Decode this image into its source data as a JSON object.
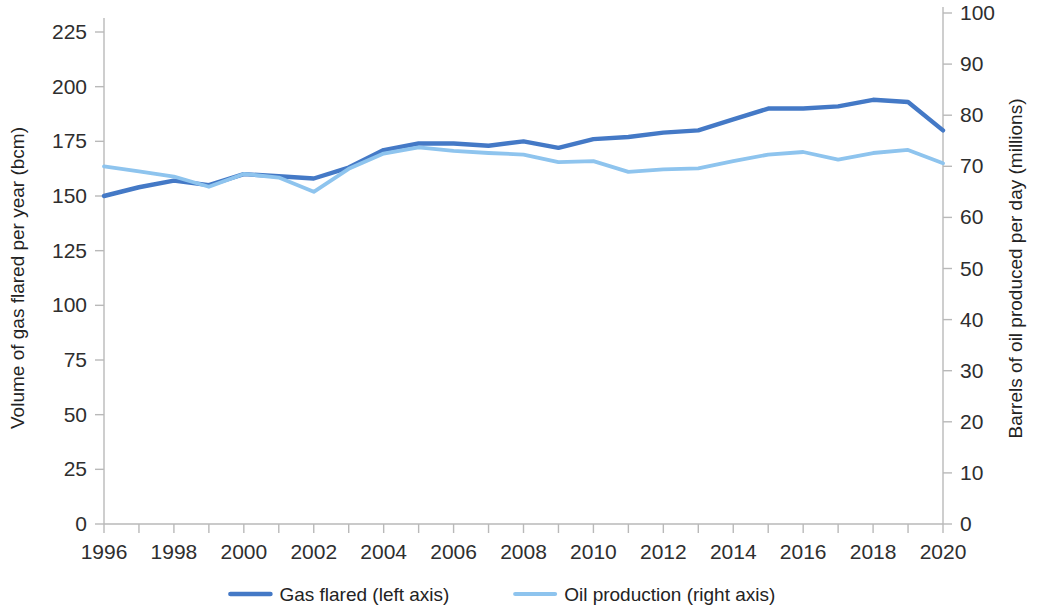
{
  "chart_data": {
    "type": "line",
    "title": "",
    "subtitle": "",
    "xlabel": "",
    "ylabel": "Volume of gas flared per year (bcm)",
    "y2label": "Barrels of oil produced per day (millions)",
    "grid": false,
    "legend_position": "bottom",
    "x": [
      1996,
      1997,
      1998,
      1999,
      2000,
      2001,
      2002,
      2003,
      2004,
      2005,
      2006,
      2007,
      2008,
      2009,
      2010,
      2011,
      2012,
      2013,
      2014,
      2015,
      2016,
      2017,
      2018,
      2019,
      2020
    ],
    "xlim": [
      1996,
      2020
    ],
    "ylim": [
      0,
      231
    ],
    "y2lim": [
      0,
      105.7
    ],
    "xticks": [
      1996,
      1997,
      1998,
      1999,
      2000,
      2001,
      2002,
      2003,
      2004,
      2005,
      2006,
      2007,
      2008,
      2009,
      2010,
      2011,
      2012,
      2013,
      2014,
      2015,
      2016,
      2017,
      2018,
      2019,
      2020
    ],
    "xtick_labels": [
      "1996",
      "",
      "1998",
      "",
      "2000",
      "",
      "2002",
      "",
      "2004",
      "",
      "2006",
      "",
      "2008",
      "",
      "2010",
      "",
      "2012",
      "",
      "2014",
      "",
      "2016",
      "",
      "2018",
      "",
      "2020"
    ],
    "yticks": [
      0,
      25,
      50,
      75,
      100,
      125,
      150,
      175,
      200,
      225
    ],
    "ytick_labels": [
      "0",
      "25",
      "50",
      "75",
      "100",
      "125",
      "150",
      "175",
      "200",
      "225"
    ],
    "y2ticks": [
      0,
      10,
      20,
      30,
      40,
      50,
      60,
      70,
      80,
      90,
      100
    ],
    "y2tick_labels": [
      "0",
      "10",
      "20",
      "30",
      "40",
      "50",
      "60",
      "70",
      "80",
      "90",
      "100"
    ],
    "series": [
      {
        "name": "Gas flared (left axis)",
        "axis": "left",
        "color": "#4479c6",
        "width": 4.4,
        "values": [
          150,
          154,
          157,
          155,
          160,
          159,
          158,
          163,
          171,
          174,
          174,
          173,
          175,
          172,
          176,
          177,
          179,
          180,
          185,
          190,
          190,
          191,
          194,
          193,
          180
        ]
      },
      {
        "name": "Oil production (right axis)",
        "axis": "right",
        "color": "#8ec4ee",
        "width": 3.8,
        "values": [
          70.0,
          69.0,
          68.0,
          66.0,
          68.5,
          67.8,
          65.0,
          69.5,
          72.5,
          73.7,
          73.0,
          72.6,
          72.3,
          70.8,
          71.0,
          68.9,
          69.4,
          69.6,
          71.0,
          72.3,
          72.8,
          71.3,
          72.6,
          73.2,
          70.6
        ]
      }
    ],
    "legend": [
      {
        "label": "Gas flared (left axis)",
        "color": "#4479c6"
      },
      {
        "label": "Oil production (right axis)",
        "color": "#8ec4ee"
      }
    ]
  },
  "colors": {
    "gas_flared": "#4479c6",
    "oil_production": "#8ec4ee",
    "axis": "#b9b9b9",
    "text": "#232323",
    "background": "#ffffff"
  }
}
